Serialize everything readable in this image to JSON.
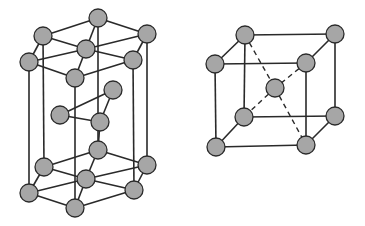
{
  "diagram": {
    "colors": {
      "atom_fill": "#a6a6a6",
      "bond": "#2a2a2a",
      "background": "#ffffff"
    },
    "atom_radius": 9,
    "structures": [
      {
        "name": "hexagonal-close-packed",
        "atoms": [
          [
            98,
            18
          ],
          [
            43,
            36
          ],
          [
            86,
            49
          ],
          [
            147,
            34
          ],
          [
            29,
            62
          ],
          [
            133,
            60
          ],
          [
            75,
            78
          ],
          [
            113,
            90
          ],
          [
            60,
            115
          ],
          [
            100,
            122
          ],
          [
            98,
            150
          ],
          [
            44,
            167
          ],
          [
            147,
            165
          ],
          [
            86,
            179
          ],
          [
            29,
            193
          ],
          [
            134,
            190
          ],
          [
            75,
            208
          ]
        ],
        "bonds": [
          [
            0,
            1
          ],
          [
            0,
            3
          ],
          [
            1,
            4
          ],
          [
            3,
            5
          ],
          [
            4,
            6
          ],
          [
            5,
            6
          ],
          [
            1,
            2
          ],
          [
            0,
            2
          ],
          [
            3,
            2
          ],
          [
            4,
            2
          ],
          [
            5,
            2
          ],
          [
            6,
            2
          ],
          [
            7,
            8
          ],
          [
            8,
            9
          ],
          [
            7,
            9
          ],
          [
            9,
            10
          ],
          [
            10,
            11
          ],
          [
            10,
            12
          ],
          [
            11,
            14
          ],
          [
            12,
            15
          ],
          [
            14,
            16
          ],
          [
            15,
            16
          ],
          [
            11,
            13
          ],
          [
            10,
            13
          ],
          [
            12,
            13
          ],
          [
            14,
            13
          ],
          [
            15,
            13
          ],
          [
            16,
            13
          ],
          [
            0,
            10
          ],
          [
            1,
            11
          ],
          [
            3,
            12
          ],
          [
            4,
            14
          ],
          [
            5,
            15
          ],
          [
            6,
            16
          ]
        ],
        "dashed_bonds": []
      },
      {
        "name": "body-centered-cubic",
        "atoms": [
          [
            245,
            35
          ],
          [
            335,
            34
          ],
          [
            215,
            64
          ],
          [
            306,
            63
          ],
          [
            275,
            88
          ],
          [
            244,
            117
          ],
          [
            335,
            116
          ],
          [
            216,
            147
          ],
          [
            306,
            145
          ]
        ],
        "bonds": [
          [
            0,
            1
          ],
          [
            0,
            2
          ],
          [
            1,
            3
          ],
          [
            2,
            3
          ],
          [
            5,
            6
          ],
          [
            5,
            7
          ],
          [
            6,
            8
          ],
          [
            7,
            8
          ],
          [
            0,
            5
          ],
          [
            1,
            6
          ],
          [
            2,
            7
          ],
          [
            3,
            8
          ]
        ],
        "dashed_bonds": [
          [
            0,
            4
          ],
          [
            4,
            8
          ],
          [
            3,
            4
          ],
          [
            4,
            5
          ]
        ]
      }
    ]
  }
}
